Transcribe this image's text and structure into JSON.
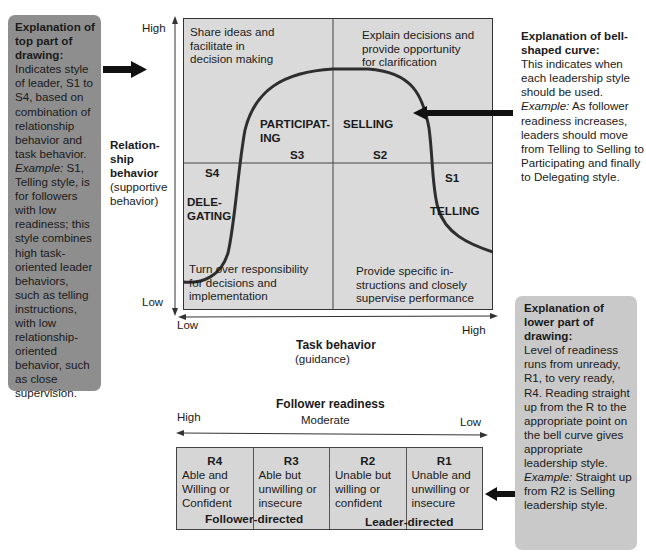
{
  "callouts": {
    "top_left": {
      "heading": "Explanation of top part of drawing:",
      "text_before_example": "Indicates style of leader, S1 to S4, based on combination of relationship behavior and task behavior.",
      "example_label": "Example:",
      "example_text": "S1, Telling style, is for followers with low readiness; this style combines high task-oriented leader behaviors, such as telling instructions, with low relationship-oriented behavior, such as close supervision."
    },
    "top_right": {
      "heading": "Explanation of bell-shaped curve:",
      "text_before_example": "This indicates when each leadership style should be used.",
      "example_label": "Example:",
      "example_text": "As follower readiness increases, leaders should move from Telling to Selling to Participating and finally to Delegating style."
    },
    "bottom_right": {
      "heading": "Explanation of lower part of drawing:",
      "text_before_example": "Level of readiness runs from unready, R1, to very ready, R4. Reading straight up from the R to the appropriate point on the bell curve gives appropriate leadership style.",
      "example_label": "Example:",
      "example_text": "Straight up from R2 is Selling leadership style."
    }
  },
  "chart": {
    "y_axis": {
      "high": "High",
      "low": "Low",
      "title_line1": "Relation-",
      "title_line2": "ship",
      "title_line3": "behavior",
      "subtitle_line1": "(supportive",
      "subtitle_line2": "behavior)"
    },
    "x_axis": {
      "low": "Low",
      "high": "High",
      "title": "Task behavior",
      "subtitle": "(guidance)"
    },
    "quadrants": {
      "top_left": [
        "Share ideas and",
        "facilitate in",
        "decision making"
      ],
      "top_right": [
        "Explain decisions and",
        "provide opportunity",
        "for clarification"
      ],
      "bottom_left": [
        "Turn over responsibility",
        "for decisions and",
        "implementation"
      ],
      "bottom_right": [
        "Provide specific in-",
        "structions and closely",
        "supervise performance"
      ]
    },
    "styles": {
      "s3_name_line1": "PARTICIPAT-",
      "s3_name_line2": "ING",
      "s3_code": "S3",
      "s2_name": "SELLING",
      "s2_code": "S2",
      "s4_code": "S4",
      "s4_name_line1": "DELE-",
      "s4_name_line2": "GATING",
      "s1_code": "S1",
      "s1_name": "TELLING"
    },
    "curve_color": "#2e2e2e",
    "box_fill": "#dadada"
  },
  "readiness": {
    "title": "Follower readiness",
    "high": "High",
    "moderate": "Moderate",
    "low": "Low",
    "levels": [
      {
        "id": "R4",
        "lines": [
          "Able and",
          "Willing or",
          "Confident"
        ]
      },
      {
        "id": "R3",
        "lines": [
          "Able but",
          "unwilling or",
          "insecure"
        ]
      },
      {
        "id": "R2",
        "lines": [
          "Unable but",
          "willing or",
          "confident"
        ]
      },
      {
        "id": "R1",
        "lines": [
          "Unable and",
          "unwilling or",
          "insecure"
        ]
      }
    ],
    "follower_directed": "Follower-directed",
    "leader_directed": "Leader-directed"
  }
}
